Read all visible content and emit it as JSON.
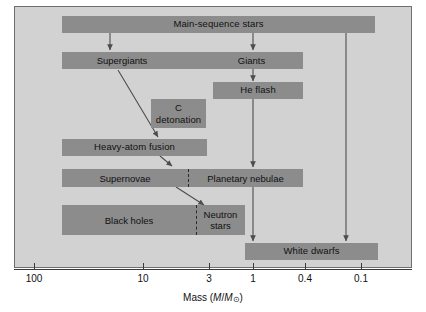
{
  "figure": {
    "kind": "stellar-evolution-flowchart",
    "panel_background": "#d2d2d2",
    "node_fill": "#8c8c8c",
    "line_color": "#555555"
  },
  "nodes": {
    "main_sequence": "Main-sequence stars",
    "supergiants": "Supergiants",
    "giants": "Giants",
    "he_flash": "He flash",
    "c_detonation_line1": "C",
    "c_detonation_line2": "detonation",
    "heavy_atom_fusion": "Heavy-atom fusion",
    "supernovae": "Supernovae",
    "planetary_nebulae": "Planetary nebulae",
    "black_holes": "Black holes",
    "neutron_stars_line1": "Neutron",
    "neutron_stars_line2": "stars",
    "white_dwarfs": "White dwarfs"
  },
  "axis": {
    "title_prefix": "Mass (",
    "title_m1": "M",
    "title_slash": "/",
    "title_m2": "M",
    "title_sun": "⊙",
    "title_suffix": ")",
    "ticks": [
      {
        "label": "100",
        "x": 34
      },
      {
        "label": "10",
        "x": 143
      },
      {
        "label": "3",
        "x": 209
      },
      {
        "label": "1",
        "x": 253
      },
      {
        "label": "0.4",
        "x": 305
      },
      {
        "label": "0.1",
        "x": 361
      }
    ]
  }
}
